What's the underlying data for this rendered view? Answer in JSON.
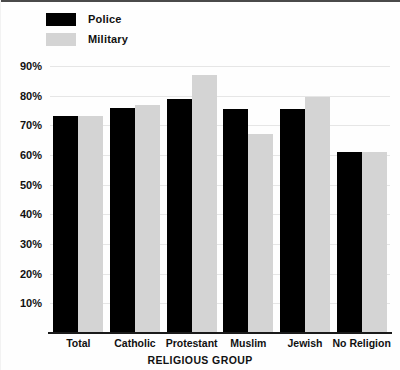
{
  "chart_data": {
    "type": "bar",
    "title": "",
    "xlabel": "RELIGIOUS GROUP",
    "ylabel": "",
    "categories": [
      "Total",
      "Catholic",
      "Protestant",
      "Muslim",
      "Jewish",
      "No Religion"
    ],
    "series": [
      {
        "name": "Police",
        "color": "#000000",
        "values": [
          73,
          76,
          79,
          75.5,
          75.5,
          61
        ]
      },
      {
        "name": "Military",
        "color": "#d4d4d4",
        "values": [
          73,
          77,
          87,
          67,
          79.5,
          61
        ]
      }
    ],
    "ylim": [
      0,
      90
    ],
    "ytick_values": [
      10,
      20,
      30,
      40,
      50,
      60,
      70,
      80,
      90
    ],
    "ytick_labels": [
      "10%",
      "20%",
      "30%",
      "40%",
      "50%",
      "60%",
      "70%",
      "80%",
      "90%"
    ],
    "grid": true,
    "legend_position": "top-left",
    "value_suffix": "%"
  },
  "legend": {
    "items": [
      {
        "label": "Police",
        "swatch": "police-swatch"
      },
      {
        "label": "Military",
        "swatch": "military-swatch"
      }
    ]
  }
}
